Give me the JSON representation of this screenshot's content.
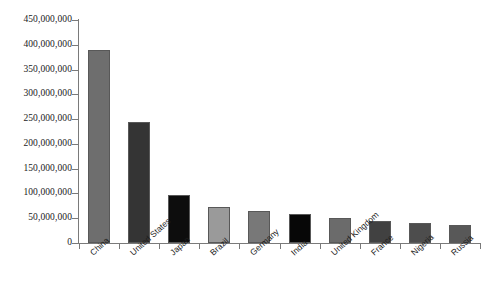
{
  "chart_data": {
    "type": "bar",
    "title": "",
    "subtitle": "",
    "xlabel": "",
    "ylabel": "",
    "legend": [],
    "grid": false,
    "legend_position": "none",
    "ylim": [
      0,
      450000000
    ],
    "ytick_step": 50000000,
    "ytick_labels": [
      "450,000,000",
      "400,000,000",
      "350,000,000",
      "300,000,000",
      "250,000,000",
      "200,000,000",
      "150,000,000",
      "100,000,000",
      "50,000,000",
      "0"
    ],
    "ytick_values": [
      450000000,
      400000000,
      350000000,
      300000000,
      250000000,
      200000000,
      150000000,
      100000000,
      50000000,
      0
    ],
    "categories": [
      "China",
      "United States",
      "Japan",
      "Brazil",
      "Germany",
      "India",
      "United Kingdom",
      "France",
      "Nigeria",
      "Russia"
    ],
    "values": [
      389000000,
      245000000,
      97000000,
      73000000,
      65000000,
      59000000,
      50000000,
      45000000,
      41000000,
      37000000
    ],
    "bar_colors": [
      "#6e6e6e",
      "#343434",
      "#0d0d0d",
      "#9a9a9a",
      "#787878",
      "#070707",
      "#6b6b6b",
      "#414141",
      "#4d4d4d",
      "#585858"
    ]
  },
  "axis_style": {
    "line_color": "#7a7a7a",
    "text_color": "#1a1a1a"
  }
}
